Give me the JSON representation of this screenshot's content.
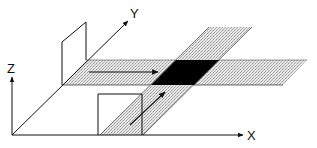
{
  "diagram": {
    "type": "3d-axes-schematic",
    "axes": {
      "x_label": "X",
      "y_label": "Y",
      "z_label": "Z"
    },
    "elements": [
      {
        "name": "vertical-plane",
        "description": "upright rectangular plane standing on Y axis"
      },
      {
        "name": "horizontal-band",
        "description": "stippled strip parallel to X axis, with arrow pointing +X"
      },
      {
        "name": "diagonal-band",
        "description": "stippled strip parallel to Y axis, with arrow pointing +Y"
      },
      {
        "name": "intersection-region",
        "description": "black parallelogram where both bands overlap"
      },
      {
        "name": "square-plane",
        "description": "upright square plane standing on X axis"
      }
    ],
    "colors": {
      "line": "#111111",
      "stipple": "#d4d4d4",
      "intersection": "#000000",
      "background": "#ffffff"
    }
  }
}
